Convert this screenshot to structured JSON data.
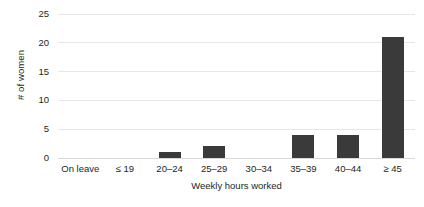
{
  "chart_data": {
    "type": "bar",
    "title": "",
    "subtitle": "",
    "xlabel": "Weekly hours worked",
    "ylabel": "# of women",
    "categories": [
      "On leave",
      "≤ 19",
      "20–24",
      "25–29",
      "30–34",
      "35–39",
      "40–44",
      "≥ 45"
    ],
    "values": [
      0,
      0,
      1,
      2,
      0,
      4,
      4,
      21
    ],
    "ylim": [
      0,
      25
    ],
    "yticks": [
      0,
      5,
      10,
      15,
      20,
      25
    ],
    "ytick_labels": [
      "0",
      "5",
      "10",
      "15",
      "20",
      "25"
    ],
    "grid": "horizontal",
    "legend": "none",
    "annotations": [],
    "colors": {
      "bar": "#3a3a3a",
      "gridline": "#e6e6e6",
      "axis": "#d9d9d9",
      "text": "#231f20",
      "background": "#ffffff"
    }
  }
}
